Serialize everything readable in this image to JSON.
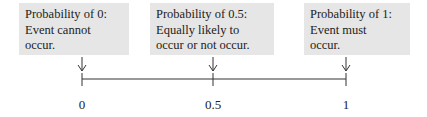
{
  "boxes": [
    {
      "title": "Probability of 0:",
      "line2": "Event cannot",
      "line3": "occur."
    },
    {
      "title": "Probability of 0.5:",
      "line2": "Equally likely to",
      "line3": "occur or not occur."
    },
    {
      "title": "Probability of 1:",
      "line2": "Event must",
      "line3": "occur."
    }
  ],
  "axis": {
    "ticks": [
      "0",
      "0.5",
      "1"
    ],
    "range": [
      0,
      1
    ]
  },
  "colors": {
    "box_fill": "#e6e6e6",
    "line": "#333333"
  }
}
